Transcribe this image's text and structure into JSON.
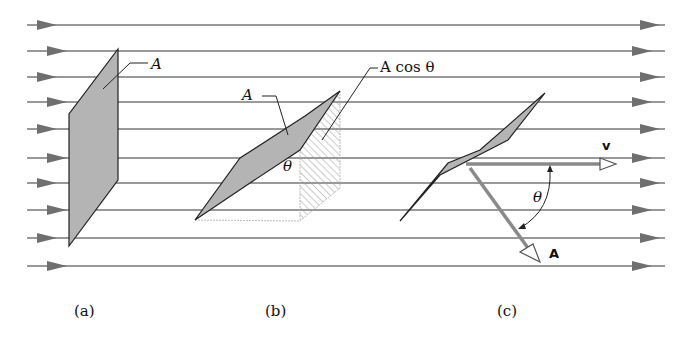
{
  "figure": {
    "flow_lines_y": [
      25,
      51,
      77,
      102,
      129,
      158,
      183,
      210,
      238,
      266
    ],
    "colors": {
      "line": "#777777",
      "arrow": "#6f6f6f",
      "area_fill": "#b4b4b4",
      "outline": "#222222",
      "vector": "#8a8a8a"
    },
    "panel_a": {
      "area_label": "A",
      "caption": "(a)"
    },
    "panel_b": {
      "area_label": "A",
      "projection_label": "A cos θ",
      "angle_label": "θ",
      "caption": "(b)"
    },
    "panel_c": {
      "velocity_label": "v",
      "area_vector_label": "A",
      "angle_label": "θ",
      "caption": "(c)"
    }
  }
}
